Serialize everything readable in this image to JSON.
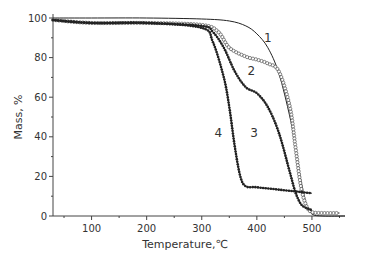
{
  "chart_data": {
    "type": "line",
    "title": "",
    "xlabel": "Temperature,℃",
    "ylabel": "Mass, %",
    "xlim": [
      30,
      560
    ],
    "ylim": [
      0,
      100
    ],
    "xticks": [
      100,
      200,
      300,
      400,
      500
    ],
    "yticks": [
      0,
      20,
      40,
      60,
      80,
      100
    ],
    "grid": false,
    "legend": "inline curve numbers",
    "series": [
      {
        "name": "1",
        "marker": "none",
        "x": [
          30,
          100,
          200,
          300,
          350,
          380,
          400,
          420,
          440,
          460,
          470,
          480,
          490,
          500,
          520,
          560
        ],
        "y": [
          100,
          100,
          100,
          99.5,
          98.5,
          96,
          92,
          85,
          72,
          50,
          35,
          18,
          6,
          1,
          0,
          0
        ]
      },
      {
        "name": "2",
        "marker": "open-circle",
        "x": [
          30,
          100,
          200,
          300,
          330,
          350,
          380,
          400,
          420,
          440,
          460,
          470,
          480,
          490,
          500,
          520,
          550
        ],
        "y": [
          99,
          97.5,
          97.5,
          96.5,
          93,
          85,
          80.5,
          79,
          77,
          73,
          55,
          35,
          15,
          5,
          2,
          1.5,
          1.5
        ]
      },
      {
        "name": "3",
        "marker": "filled-dot",
        "x": [
          30,
          100,
          200,
          300,
          320,
          340,
          360,
          380,
          400,
          420,
          440,
          460,
          470,
          480,
          490,
          500
        ],
        "y": [
          99,
          97.5,
          97.5,
          96,
          93,
          85,
          73,
          65,
          62,
          55,
          42,
          22,
          12,
          6,
          4,
          3
        ]
      },
      {
        "name": "4",
        "marker": "filled-dot",
        "x": [
          30,
          100,
          200,
          300,
          320,
          340,
          350,
          360,
          370,
          380,
          400,
          450,
          500
        ],
        "y": [
          99,
          97.5,
          97.5,
          95,
          88,
          70,
          55,
          35,
          20,
          15,
          14.5,
          13,
          11.5
        ]
      }
    ],
    "annotations": [
      {
        "text": "1",
        "x": 420,
        "y": 88
      },
      {
        "text": "2",
        "x": 390,
        "y": 71
      },
      {
        "text": "3",
        "x": 395,
        "y": 40
      },
      {
        "text": "4",
        "x": 330,
        "y": 40
      }
    ]
  }
}
